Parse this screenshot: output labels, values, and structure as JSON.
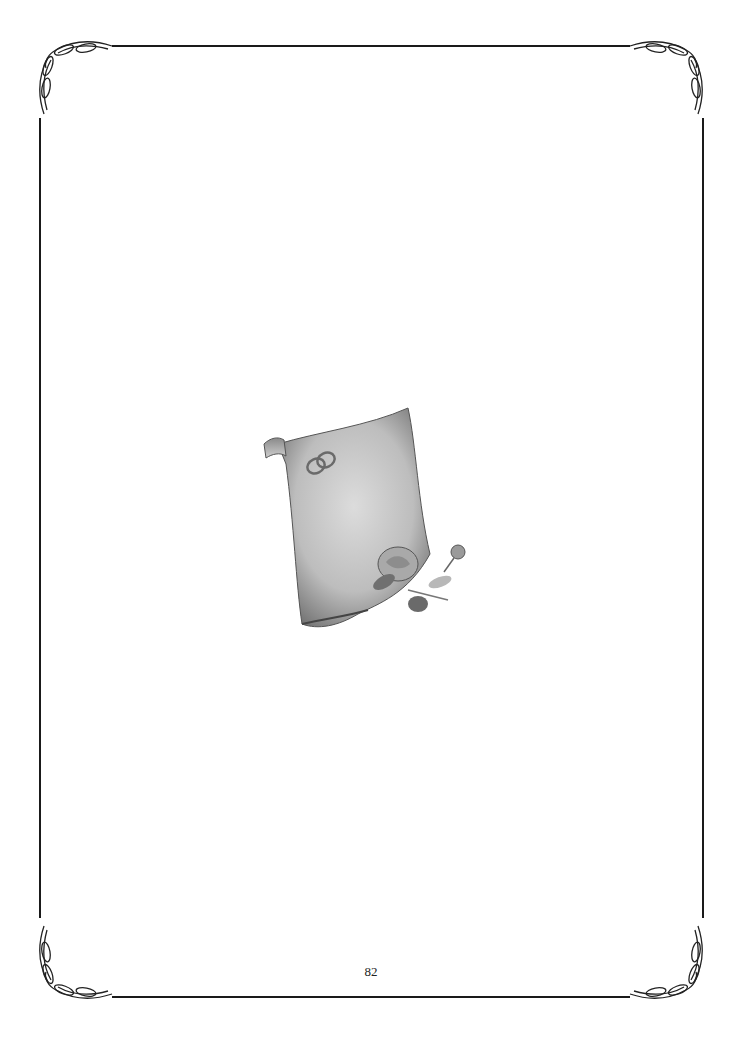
{
  "page": {
    "page_number": "82",
    "illustration": {
      "subject": "parchment scroll with wedding rings and roses",
      "elements": [
        "scroll-icon",
        "wedding-rings-icon",
        "rose-bouquet-icon"
      ]
    },
    "border": {
      "style": "ornamental flourish corners with thin rule lines",
      "color": "#1a1a1a"
    }
  }
}
